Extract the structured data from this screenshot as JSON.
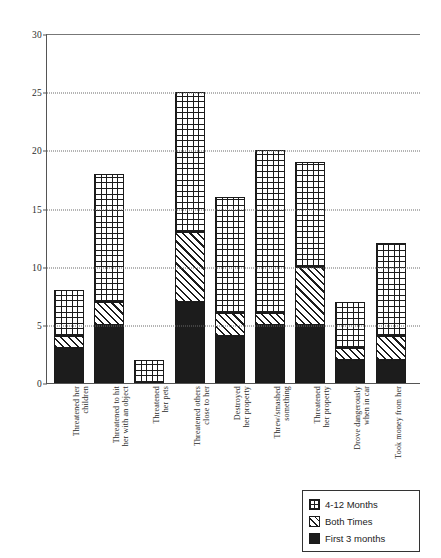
{
  "chart_data": {
    "type": "bar",
    "stacked": true,
    "title": "",
    "xlabel": "",
    "ylabel": "",
    "ylim": [
      0,
      30
    ],
    "yticks": [
      0,
      5,
      10,
      15,
      20,
      25,
      30
    ],
    "grid": "horizontal-dotted",
    "legend_position": "bottom-right",
    "categories": [
      "Threatened her children",
      "Threatened to hit her with an object",
      "Threatened her pets",
      "Threatened others close to her",
      "Destroyed her property",
      "Threw/smashed something",
      "Threatened her property",
      "Drove dangerously when in car",
      "Took money from her"
    ],
    "category_lines": [
      [
        "Threatened her",
        "children"
      ],
      [
        "Threatened to hit",
        "her with an object"
      ],
      [
        "Threatened",
        "her pets"
      ],
      [
        "Threatened others",
        "close to her"
      ],
      [
        "Destroyed",
        "her property"
      ],
      [
        "Threw/smashed",
        "something"
      ],
      [
        "Threatened",
        "her property"
      ],
      [
        "Drove dangerously",
        "when in car"
      ],
      [
        "Took money from her"
      ]
    ],
    "series": [
      {
        "name": "First 3 months",
        "pattern": "solid-black",
        "color": "#1c1c1c",
        "values": [
          3,
          5,
          0,
          7,
          4,
          5,
          5,
          2,
          2
        ]
      },
      {
        "name": "Both Times",
        "pattern": "diagonal-hatch",
        "color": "#ffffff",
        "values": [
          1,
          2,
          0,
          6,
          2,
          1,
          5,
          1,
          2
        ]
      },
      {
        "name": "4-12 Months",
        "pattern": "grid-hatch",
        "color": "#ffffff",
        "values": [
          4,
          11,
          2,
          12,
          10,
          14,
          9,
          4,
          8
        ]
      }
    ],
    "totals": [
      8,
      18,
      2,
      25,
      16,
      20,
      19,
      7,
      12
    ]
  },
  "legend": {
    "items": [
      {
        "label": "4-12 Months",
        "pattern": "months"
      },
      {
        "label": "Both Times",
        "pattern": "both"
      },
      {
        "label": "First 3 months",
        "pattern": "first"
      }
    ]
  }
}
